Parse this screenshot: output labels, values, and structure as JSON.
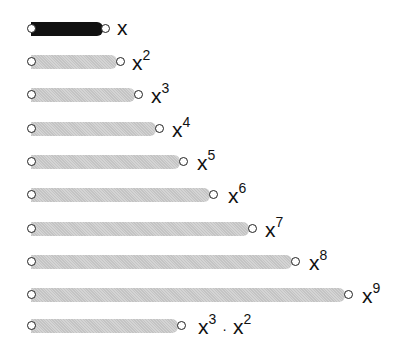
{
  "diagram": {
    "rows": [
      {
        "base": "x",
        "exp": "",
        "extra_base": "",
        "extra_exp": "",
        "length": 1,
        "style": "dark"
      },
      {
        "base": "x",
        "exp": "2",
        "extra_base": "",
        "extra_exp": "",
        "length": 2,
        "style": "light"
      },
      {
        "base": "x",
        "exp": "3",
        "extra_base": "",
        "extra_exp": "",
        "length": 3,
        "style": "light"
      },
      {
        "base": "x",
        "exp": "4",
        "extra_base": "",
        "extra_exp": "",
        "length": 4,
        "style": "light"
      },
      {
        "base": "x",
        "exp": "5",
        "extra_base": "",
        "extra_exp": "",
        "length": 5,
        "style": "light"
      },
      {
        "base": "x",
        "exp": "6",
        "extra_base": "",
        "extra_exp": "",
        "length": 6,
        "style": "light"
      },
      {
        "base": "x",
        "exp": "7",
        "extra_base": "",
        "extra_exp": "",
        "length": 7,
        "style": "light"
      },
      {
        "base": "x",
        "exp": "8",
        "extra_base": "",
        "extra_exp": "",
        "length": 8,
        "style": "light"
      },
      {
        "base": "x",
        "exp": "9",
        "extra_base": "",
        "extra_exp": "",
        "length": 9,
        "style": "light"
      },
      {
        "base": "x",
        "exp": "3",
        "separator": "·",
        "extra_base": "x",
        "extra_exp": "2",
        "length": 5,
        "style": "light"
      }
    ]
  }
}
